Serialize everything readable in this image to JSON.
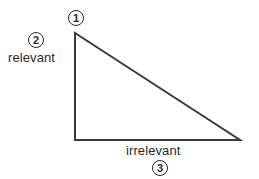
{
  "diagram": {
    "type": "right-triangle",
    "line_color": "#3a3a3a",
    "vertices": {
      "top": [
        75,
        33
      ],
      "bottom_left": [
        75,
        140
      ],
      "bottom_right": [
        240,
        140
      ]
    },
    "markers": [
      {
        "id": "1",
        "label": "1",
        "position": "top vertex"
      },
      {
        "id": "2",
        "label": "2",
        "position": "left side"
      },
      {
        "id": "3",
        "label": "3",
        "position": "bottom side"
      }
    ],
    "labels": {
      "left_side": "relevant",
      "bottom_side": "irrelevant"
    }
  }
}
